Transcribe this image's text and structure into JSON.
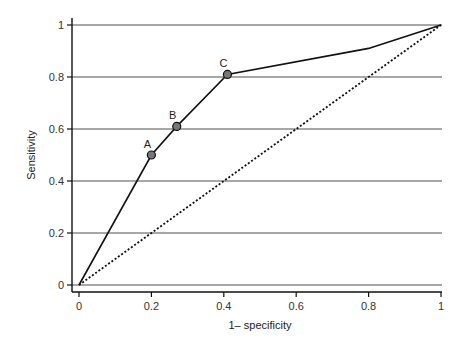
{
  "chart_data": {
    "type": "line",
    "title": "",
    "xlabel": "1– specificity",
    "ylabel": "Sensitivity",
    "xlim": [
      0,
      1
    ],
    "ylim": [
      0,
      1
    ],
    "x_ticks": [
      "0",
      "0.2",
      "0.4",
      "0.6",
      "0.8",
      "1"
    ],
    "y_ticks": [
      "0",
      "0.2",
      "0.4",
      "0.6",
      "0.8",
      "1"
    ],
    "grid": "horizontal",
    "legend": "none",
    "series": [
      {
        "name": "ROC curve",
        "style": "solid",
        "x": [
          0,
          0.2,
          0.27,
          0.41,
          0.8,
          1
        ],
        "y": [
          0,
          0.5,
          0.61,
          0.81,
          0.91,
          1
        ]
      },
      {
        "name": "Chance line",
        "style": "dotted",
        "x": [
          0,
          1
        ],
        "y": [
          0,
          1
        ]
      }
    ],
    "annotations": [
      {
        "label": "A",
        "x": 0.2,
        "y": 0.5
      },
      {
        "label": "B",
        "x": 0.27,
        "y": 0.61
      },
      {
        "label": "C",
        "x": 0.41,
        "y": 0.81
      }
    ]
  },
  "colors": {
    "grid": "#8a8a8a",
    "line": "#111111",
    "marker_fill": "#777777",
    "marker_stroke": "#111111"
  }
}
